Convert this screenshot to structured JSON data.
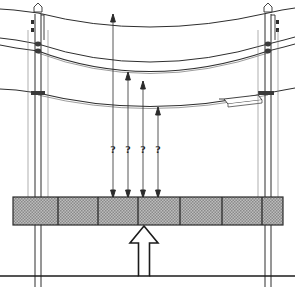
{
  "diagram": {
    "type": "engineering-elevation",
    "colors": {
      "line": "#1b1b1b",
      "cable": "#3a3a3a",
      "ground_fill": "#b4b4b4",
      "ground_hatch": "#6e6e6e",
      "background": "#ffffff"
    },
    "poles": [
      {
        "name": "left-pole",
        "x": 38,
        "top_y": 6,
        "bottom_y": 287
      },
      {
        "name": "right-pole",
        "x": 268,
        "top_y": 6,
        "bottom_y": 287
      }
    ],
    "cables": [
      {
        "name": "shield-wire",
        "left_y": 13,
        "mid_y": 27,
        "right_y": 13
      },
      {
        "name": "upper-conductor",
        "left_y": 43,
        "mid_y": 62,
        "right_y": 43
      },
      {
        "name": "middle-conductor",
        "left_y": 50,
        "mid_y": 73,
        "right_y": 50
      },
      {
        "name": "lower-conductor",
        "left_y": 93,
        "mid_y": 106,
        "right_y": 93
      }
    ],
    "equipment_box": {
      "name": "line-mounted-box",
      "x": 224,
      "y": 95,
      "width": 38,
      "height": 11
    },
    "dimension_lines": [
      {
        "name": "dim-1",
        "x": 113,
        "top_y": 14,
        "bottom_y": 198,
        "label": "?",
        "label_y": 149
      },
      {
        "name": "dim-2",
        "x": 128,
        "top_y": 72,
        "bottom_y": 198,
        "label": "?",
        "label_y": 149
      },
      {
        "name": "dim-3",
        "x": 143,
        "top_y": 81,
        "bottom_y": 198,
        "label": "?",
        "label_y": 149
      },
      {
        "name": "dim-4",
        "x": 158,
        "top_y": 107,
        "bottom_y": 198,
        "label": "?",
        "label_y": 149
      }
    ],
    "ground": {
      "name": "ground-strip",
      "x": 13,
      "y": 197,
      "width": 270,
      "height": 28,
      "dividers": [
        58,
        98,
        138,
        180,
        222,
        262
      ]
    },
    "callout": {
      "name": "ground-callout-arrow",
      "tip_x": 144,
      "tip_y": 226,
      "stem_bottom_y": 276,
      "leader_y": 276,
      "leader_x_start": 0,
      "leader_x_end": 295
    }
  }
}
